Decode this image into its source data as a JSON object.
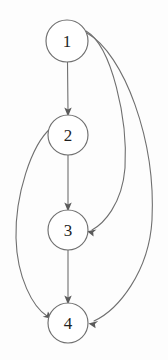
{
  "figure": {
    "background_color": "#fdfdfd",
    "edge_color": "#6f6f6f",
    "node_fill_color": "#ffffff",
    "node_stroke_color": "#6f6f6f",
    "label_color": "#1f1f1f"
  },
  "graph_data": {
    "type": "directed-graph",
    "node_count": 4,
    "edge_count": 6,
    "nodes": [
      {
        "id": "1",
        "label": "1",
        "cx": 67,
        "cy": 41,
        "r": 21
      },
      {
        "id": "2",
        "label": "2",
        "cx": 68,
        "cy": 135,
        "r": 20
      },
      {
        "id": "3",
        "label": "3",
        "cx": 68,
        "cy": 230,
        "r": 20
      },
      {
        "id": "4",
        "label": "4",
        "cx": 68,
        "cy": 323,
        "r": 20
      }
    ],
    "edges": [
      {
        "from": "1",
        "to": "2",
        "shape": "straight",
        "side": "center"
      },
      {
        "from": "2",
        "to": "3",
        "shape": "straight",
        "side": "center"
      },
      {
        "from": "3",
        "to": "4",
        "shape": "straight",
        "side": "center"
      },
      {
        "from": "1",
        "to": "3",
        "shape": "curved",
        "side": "right"
      },
      {
        "from": "1",
        "to": "4",
        "shape": "curved",
        "side": "right"
      },
      {
        "from": "2",
        "to": "4",
        "shape": "curved",
        "side": "left"
      }
    ]
  }
}
